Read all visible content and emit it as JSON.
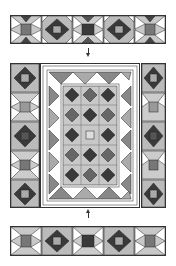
{
  "diagram": {
    "type": "quilt-assembly",
    "colors": {
      "dark": "#3a3a3a",
      "mid": "#7a7a7a",
      "light": "#b9b9b9",
      "pale": "#e6e6e6",
      "white": "#ffffff",
      "line": "#222222"
    },
    "parts": [
      {
        "id": "top-border-strip",
        "blocks": 5
      },
      {
        "id": "arrow-down"
      },
      {
        "id": "left-side-border",
        "blocks": 5
      },
      {
        "id": "center-panel",
        "rows": 5,
        "cols": 3
      },
      {
        "id": "right-side-border",
        "blocks": 5
      },
      {
        "id": "arrow-up"
      },
      {
        "id": "bottom-border-strip",
        "blocks": 5
      }
    ]
  }
}
